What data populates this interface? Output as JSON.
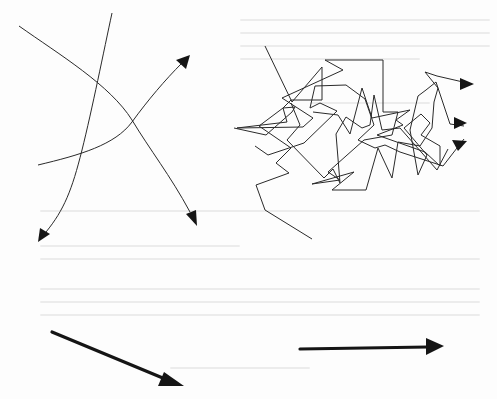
{
  "page": {
    "background": "#fdfdfd",
    "ink_color": "#1a1a1a",
    "bleed_through_text": "illegible"
  },
  "figures": [
    {
      "id": "crossing-curves",
      "description": "Three smooth curved lines crossing each other, each ending in an arrowhead",
      "arrow_count": 3
    },
    {
      "id": "tangled-path",
      "description": "A chaotic zig-zag polyline tangle that resolves into three arrowheads pointing right",
      "arrow_count": 3
    },
    {
      "id": "diagonal-arrow",
      "description": "A single thick straight arrow pointing down-right",
      "arrow_count": 1
    },
    {
      "id": "horizontal-arrow",
      "description": "A single thick straight arrow pointing right",
      "arrow_count": 1
    }
  ]
}
